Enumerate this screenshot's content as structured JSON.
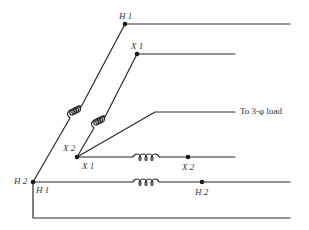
{
  "diagram": {
    "colors": {
      "line": "#2a2a2a",
      "background": "#ffffff"
    },
    "labels": {
      "top_h1": "H 1",
      "top_x1": "X 1",
      "mid_x2": "X 2",
      "mid_x1": "X 1",
      "right_x2": "X 2",
      "left_h2": "H 2",
      "left_h1": "H 1",
      "right_h2": "H 2"
    },
    "load_label": "To 3-φ load",
    "components": [
      {
        "type": "coil",
        "name": "primary-winding-1",
        "orientation": "diagonal"
      },
      {
        "type": "coil",
        "name": "secondary-winding-1",
        "orientation": "diagonal"
      },
      {
        "type": "coil",
        "name": "secondary-winding-2",
        "orientation": "horizontal"
      },
      {
        "type": "coil",
        "name": "primary-winding-2",
        "orientation": "horizontal"
      }
    ]
  }
}
